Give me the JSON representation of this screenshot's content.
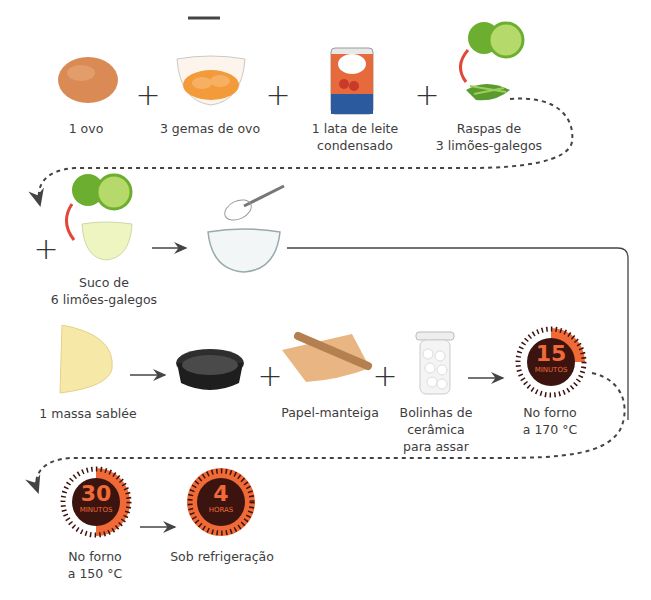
{
  "header": {
    "minus_mark": "—"
  },
  "row1": {
    "items": [
      {
        "id": "ovo",
        "label": "1 ovo",
        "icon": "egg-icon"
      },
      {
        "id": "gemas",
        "label": "3 gemas de ovo",
        "icon": "egg-yolks-bowl-icon"
      },
      {
        "id": "leite",
        "label": "1 lata de leite\ncondensado",
        "icon": "condensed-milk-can-icon"
      },
      {
        "id": "raspas",
        "label": "Raspas de\n3 limões-galegos",
        "icon": "lime-zest-icon"
      }
    ],
    "operators": [
      "+",
      "+",
      "+"
    ]
  },
  "row2": {
    "items": [
      {
        "id": "suco",
        "label": "Suco de\n6 limões-galegos",
        "icon": "lime-juice-icon"
      },
      {
        "id": "tigela",
        "label": "",
        "icon": "whisk-bowl-icon"
      }
    ],
    "operators": [
      "+"
    ]
  },
  "row3": {
    "items": [
      {
        "id": "massa",
        "label": "1 massa sablée",
        "icon": "pastry-dough-icon"
      },
      {
        "id": "forma",
        "label": "",
        "icon": "tart-pan-icon"
      },
      {
        "id": "papel",
        "label": "Papel-manteiga",
        "icon": "parchment-paper-icon"
      },
      {
        "id": "bolinhas",
        "label": "Bolinhas de\ncerâmica\npara assar",
        "icon": "ceramic-beads-jar-icon"
      },
      {
        "id": "forno170",
        "label": "No forno\na 170 °C",
        "icon": "timer-icon"
      }
    ],
    "operators": [
      "+",
      "+"
    ]
  },
  "row4": {
    "items": [
      {
        "id": "forno150",
        "label": "No forno\na 150 °C",
        "icon": "timer-icon"
      },
      {
        "id": "geladeira",
        "label": "Sob refrigeração",
        "icon": "timer-icon"
      }
    ]
  },
  "timers": [
    {
      "value": "15",
      "unit": "MINUTOS",
      "fraction": 0.25
    },
    {
      "value": "30",
      "unit": "MINUTOS",
      "fraction": 0.5
    },
    {
      "value": "4",
      "unit": "HORAS",
      "fraction": 1.0
    }
  ],
  "colors": {
    "accent_orange": "#ef6a36",
    "timer_dark": "#3b1410",
    "arrow": "#444444",
    "lime_green": "#7dbf3a",
    "red_arc": "#e0483a"
  }
}
